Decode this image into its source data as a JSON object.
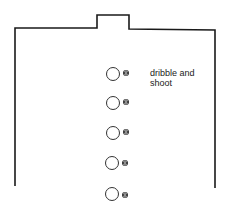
{
  "diagram": {
    "court": {
      "outline_color": "#1a1a1a",
      "left_x": 15,
      "right_x": 215,
      "baseline_y": 28,
      "notch": {
        "x1": 97,
        "x2": 129,
        "top_y": 15
      },
      "left_bottom_y": 186,
      "right_bottom_y": 188
    },
    "players": [
      {
        "id": "player-1",
        "cx": 113,
        "cy": 74
      },
      {
        "id": "player-2",
        "cx": 113,
        "cy": 103
      },
      {
        "id": "player-3",
        "cx": 113,
        "cy": 133
      },
      {
        "id": "player-4",
        "cx": 112,
        "cy": 163
      },
      {
        "id": "player-5",
        "cx": 112,
        "cy": 194
      }
    ],
    "ball_icon": "basketball-icon",
    "annotation": {
      "line1": "dribble and",
      "line2": "shoot"
    }
  }
}
